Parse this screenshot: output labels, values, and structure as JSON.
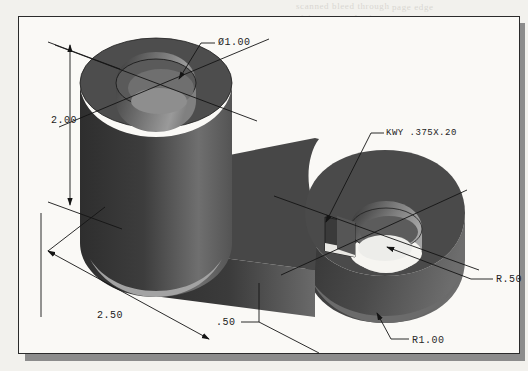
{
  "figure": {
    "kind": "isometric-cad-solid-render",
    "background_page_color": "#f2f1ed",
    "frame_border_color": "#2b2b2b",
    "frame_fill_color": "#faf9f6",
    "shadow_color": "#8c8c8c"
  },
  "ghost_text": {
    "line1": "scanned bleed through",
    "line2": "faint reversed print",
    "line3": "page edge"
  },
  "dimensions": [
    {
      "id": "bore-diameter",
      "label": "Ø1.00",
      "type": "diameter",
      "value": 1.0,
      "units": "in"
    },
    {
      "id": "boss-height",
      "label": "2.00",
      "type": "linear",
      "value": 2.0,
      "units": "in"
    },
    {
      "id": "overall-length",
      "label": "2.50",
      "type": "linear",
      "value": 2.5,
      "units": "in"
    },
    {
      "id": "plate-thickness",
      "label": ".50",
      "type": "linear",
      "value": 0.5,
      "units": "in"
    },
    {
      "id": "keyway-callout",
      "label": "KWY .375X.20",
      "type": "note",
      "width": 0.375,
      "depth": 0.2,
      "units": "in"
    },
    {
      "id": "small-hole-radius",
      "label": "R.50",
      "type": "radius",
      "value": 0.5,
      "units": "in"
    },
    {
      "id": "pad-radius",
      "label": "R1.00",
      "type": "radius",
      "value": 1.0,
      "units": "in"
    }
  ],
  "shading": {
    "boss_top_annulus": "#4f4f4f",
    "boss_side_dark": "#343434",
    "boss_side_light": "#7c7c7c",
    "bore_inner_light": "#8a8a8a",
    "plate_top": "#4a4a4a",
    "plate_side_dark": "#303030",
    "plate_side_light": "#6f6f6f",
    "hole_bore_light": "#9a9a9a",
    "centerline_color": "#141414",
    "leader_color": "#141414"
  }
}
